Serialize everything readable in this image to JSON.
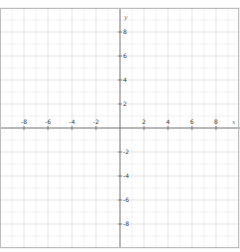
{
  "chart_data": {
    "type": "line",
    "title": "",
    "xlabel": "x",
    "ylabel": "y",
    "xlim": [
      -10,
      10
    ],
    "ylim": [
      -10,
      10
    ],
    "grid": true,
    "minor_grid_step": 1,
    "major_grid_step": 2,
    "x_tick_labels": [
      "-8",
      "-6",
      "-4",
      "-2",
      "2",
      "4",
      "6",
      "8"
    ],
    "x_tick_values": [
      -8,
      -6,
      -4,
      -2,
      2,
      4,
      6,
      8
    ],
    "y_tick_labels": [
      "8",
      "6",
      "4",
      "2",
      "-2",
      "-4",
      "-6",
      "-8"
    ],
    "y_tick_values": [
      8,
      6,
      4,
      2,
      -2,
      -4,
      -6,
      -8
    ],
    "series": [],
    "legend": null
  },
  "axes": {
    "x_name": "x",
    "y_name": "y"
  },
  "colors": {
    "minor_grid": "#ececec",
    "major_grid": "#dcdcdc",
    "axis": "#666666",
    "frame": "#bdbdbd",
    "label": "#444444"
  }
}
